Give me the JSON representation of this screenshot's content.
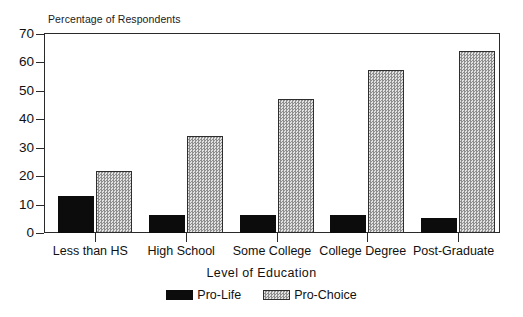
{
  "chart_data": {
    "type": "bar",
    "title": "Percentage of Respondents",
    "xlabel": "Level  of  Education",
    "ylabel": "",
    "ylim": [
      0,
      70
    ],
    "ytick_step": 10,
    "yticks": [
      0,
      10,
      20,
      30,
      40,
      50,
      60,
      70
    ],
    "grid": false,
    "legend_position": "bottom-center",
    "categories": [
      "Less than HS",
      "High School",
      "Some College",
      "College Degree",
      "Post-Graduate"
    ],
    "series": [
      {
        "name": "Pro-Life",
        "color": "#0c0c0c",
        "fill": "solid-black",
        "values": [
          13,
          6.3,
          6.3,
          6.4,
          5.2
        ]
      },
      {
        "name": "Pro-Choice",
        "color": "#b9b9b9",
        "fill": "stippled-gray",
        "values": [
          21.7,
          34.3,
          47,
          57.4,
          64
        ]
      }
    ]
  },
  "legend": {
    "items": [
      {
        "label": "Pro-Life",
        "swatch": "solid-black-swatch"
      },
      {
        "label": "Pro-Choice",
        "swatch": "stippled-gray-swatch"
      }
    ]
  }
}
